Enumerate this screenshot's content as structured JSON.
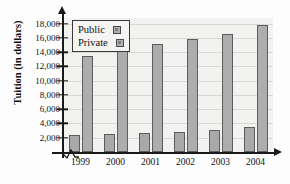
{
  "chart_data": {
    "type": "bar",
    "title": "",
    "xlabel": "",
    "ylabel": "Tuition (in dollars)",
    "categories": [
      "1999",
      "2000",
      "2001",
      "2002",
      "2003",
      "2004"
    ],
    "series": [
      {
        "name": "Public",
        "values": [
          2400,
          2500,
          2650,
          2850,
          3050,
          3500
        ]
      },
      {
        "name": "Private",
        "values": [
          13500,
          14150,
          15150,
          15900,
          16550,
          17750
        ]
      }
    ],
    "ylim": [
      0,
      18800
    ],
    "yticks": [
      2000,
      4000,
      6000,
      8000,
      10000,
      12000,
      14000,
      16000,
      18000
    ],
    "ytick_labels": [
      "2,000",
      "4,000",
      "6,000",
      "8,000",
      "10,000",
      "12,000",
      "14,000",
      "16,000",
      "18,000"
    ],
    "grid": true,
    "legend_position": "top-left",
    "axis_break": true,
    "colors": {
      "public_fill": "#a9a9a9",
      "private_fill": "#adadad",
      "bar_outline": "#5c5c5c",
      "plot_background": "#f2f2f0",
      "gridline": "#d8d8d4",
      "axis": "#1a1a1a",
      "text": "#111111"
    }
  },
  "legend": {
    "items": [
      {
        "label": "Public"
      },
      {
        "label": "Private"
      }
    ]
  }
}
